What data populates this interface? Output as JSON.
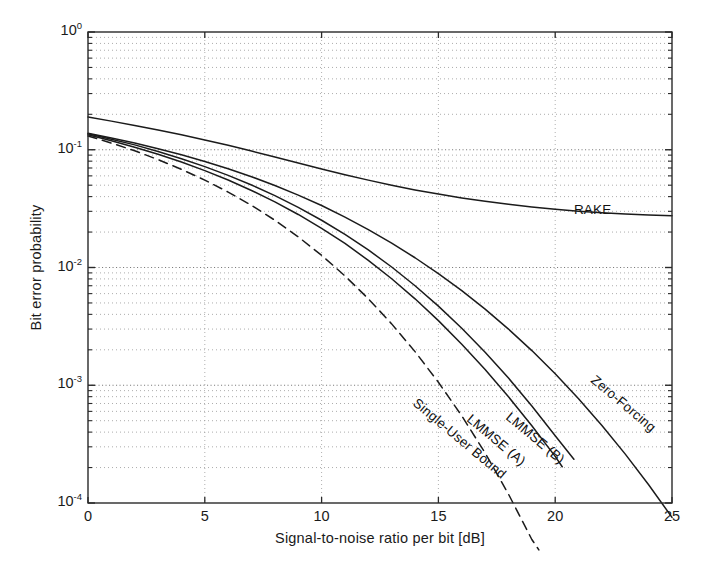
{
  "chart_data": {
    "type": "line",
    "title": "",
    "xlabel": "Signal-to-noise ratio per bit [dB]",
    "ylabel": "Bit error probability",
    "xlim": [
      0,
      25
    ],
    "ylim": [
      0.0001,
      1
    ],
    "yscale": "log",
    "xticks": [
      0,
      5,
      10,
      15,
      20,
      25
    ],
    "xtick_labels": [
      "0",
      "5",
      "10",
      "15",
      "20",
      "25"
    ],
    "yticks": [
      1,
      0.1,
      0.01,
      0.001,
      0.0001
    ],
    "ytick_labels": [
      "10",
      "10",
      "10",
      "10",
      "10"
    ],
    "ytick_exponents": [
      "0",
      "-1",
      "-2",
      "-3",
      "-4"
    ],
    "grid": true,
    "grid_style": "dotted-minor-and-major",
    "legend_position": "inline-curve-labels",
    "series": [
      {
        "name": "RAKE",
        "style": "solid",
        "label_x": 20.8,
        "label_y": 0.0315,
        "label_rotation": 0,
        "x": [
          0,
          1,
          2,
          3,
          4,
          5,
          6,
          7,
          8,
          9,
          10,
          11,
          12,
          13,
          14,
          15,
          16,
          17,
          18,
          19,
          20,
          21,
          22,
          23,
          24,
          25
        ],
        "y": [
          0.19,
          0.175,
          0.161,
          0.147,
          0.134,
          0.121,
          0.109,
          0.0975,
          0.0868,
          0.0772,
          0.0687,
          0.0614,
          0.0552,
          0.05,
          0.0456,
          0.042,
          0.039,
          0.0365,
          0.0344,
          0.0327,
          0.0313,
          0.0301,
          0.0292,
          0.0285,
          0.0279,
          0.0275
        ]
      },
      {
        "name": "Zero-Forcing",
        "style": "solid",
        "label_x": 21.6,
        "label_y": 0.00115,
        "label_rotation": 40,
        "x": [
          0,
          1,
          2,
          3,
          4,
          5,
          6,
          7,
          8,
          9,
          10,
          11,
          12,
          13,
          14,
          15,
          16,
          17,
          18,
          19,
          20,
          21,
          22,
          23,
          24,
          25
        ],
        "y": [
          0.138,
          0.126,
          0.114,
          0.102,
          0.0905,
          0.0795,
          0.069,
          0.059,
          0.0497,
          0.0412,
          0.0336,
          0.0268,
          0.021,
          0.0161,
          0.0121,
          0.00888,
          0.00636,
          0.00443,
          0.003,
          0.00197,
          0.00125,
          0.000767,
          0.000455,
          0.00026,
          0.000143,
          7.55e-05
        ]
      },
      {
        "name": "LMMSE (B)",
        "style": "solid",
        "label_x": 18.0,
        "label_y": 0.00056,
        "label_rotation": 40,
        "x": [
          0,
          1,
          2,
          3,
          4,
          5,
          6,
          7,
          8,
          9,
          10,
          11,
          12,
          13,
          14,
          15,
          16,
          17,
          18,
          19,
          20,
          20.8
        ],
        "y": [
          0.137,
          0.123,
          0.11,
          0.0965,
          0.084,
          0.0719,
          0.0606,
          0.0502,
          0.0408,
          0.0324,
          0.0252,
          0.0191,
          0.0141,
          0.0101,
          0.007,
          0.0047,
          0.00305,
          0.00191,
          0.00115,
          0.000667,
          0.000373,
          0.000235
        ]
      },
      {
        "name": "LMMSE (A)",
        "style": "solid",
        "label_x": 16.3,
        "label_y": 0.00054,
        "label_rotation": 40,
        "x": [
          0,
          1,
          2,
          3,
          4,
          5,
          6,
          7,
          8,
          9,
          10,
          11,
          12,
          13,
          14,
          15,
          16,
          17,
          18,
          19,
          20,
          20.3
        ],
        "y": [
          0.134,
          0.119,
          0.105,
          0.0915,
          0.0786,
          0.0665,
          0.0553,
          0.0451,
          0.0361,
          0.0282,
          0.0215,
          0.016,
          0.0115,
          0.00802,
          0.00542,
          0.00354,
          0.00223,
          0.00136,
          0.000798,
          0.000453,
          0.000249,
          0.000203
        ]
      },
      {
        "name": "Single-User Bound",
        "style": "dashed",
        "label_x": 14.0,
        "label_y": 0.00073,
        "label_rotation": 40,
        "x": [
          0,
          1,
          2,
          3,
          4,
          5,
          6,
          7,
          8,
          9,
          10,
          11,
          12,
          13,
          14,
          15,
          16,
          17,
          18,
          19,
          19.3
        ],
        "y": [
          0.131,
          0.114,
          0.098,
          0.0825,
          0.0682,
          0.0552,
          0.0437,
          0.0337,
          0.0252,
          0.0182,
          0.0127,
          0.00848,
          0.00543,
          0.00332,
          0.00193,
          0.00106,
          0.00055,
          0.000266,
          0.000119,
          4.9e-05,
          4e-05
        ]
      }
    ]
  }
}
